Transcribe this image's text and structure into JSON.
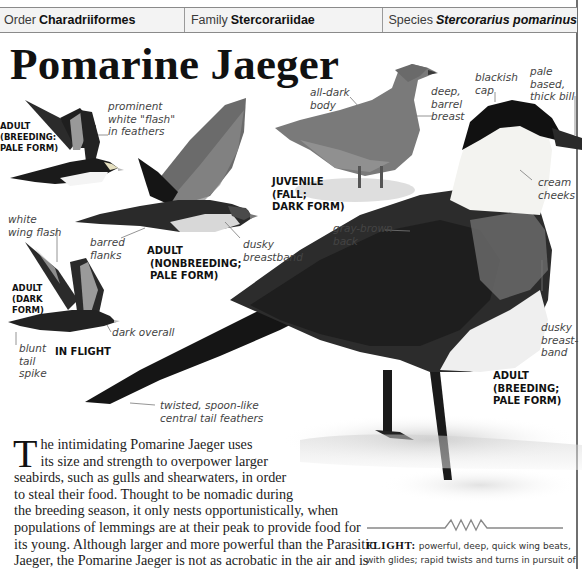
{
  "taxonomy": {
    "order_label": "Order",
    "order_value": "Charadriiformes",
    "family_label": "Family",
    "family_value": "Stercorariidae",
    "species_label": "Species",
    "species_value": "Stercorarius pomarinus"
  },
  "title": "Pomarine Jaeger",
  "illustrations": {
    "captions": {
      "adult_breeding_pale_flight": [
        "ADULT",
        "(BREEDING:",
        "PALE FORM)"
      ],
      "adult_nonbreeding_pale": [
        "ADULT",
        "(NONBREEDING;",
        "PALE FORM)"
      ],
      "adult_dark_form": [
        "ADULT",
        "(DARK",
        "FORM)"
      ],
      "in_flight": "IN FLIGHT",
      "juvenile": [
        "JUVENILE",
        "(FALL;",
        "DARK FORM)"
      ],
      "adult_breeding_pale_photo": [
        "ADULT",
        "(BREEDING;",
        "PALE FORM)"
      ]
    },
    "labels": {
      "prominent_flash": [
        "prominent",
        "white \"flash\"",
        "in feathers"
      ],
      "white_wing_flash": [
        "white",
        "wing flash"
      ],
      "barred_flanks": [
        "barred",
        "flanks"
      ],
      "dusky_breastband_flight": [
        "dusky",
        "breastband"
      ],
      "dark_overall": "dark overall",
      "blunt_tail_spike": [
        "blunt",
        "tail",
        "spike"
      ],
      "all_dark_body": [
        "all-dark",
        "body"
      ],
      "deep_barrel_breast": [
        "deep,",
        "barrel",
        "breast"
      ],
      "blackish_cap": [
        "blackish",
        "cap"
      ],
      "pale_based_bill": [
        "pale",
        "based,",
        "thick bill"
      ],
      "cream_cheeks": [
        "cream",
        "cheeks"
      ],
      "gray_brown_back": [
        "gray-brown",
        "back"
      ],
      "dusky_breastband_photo": [
        "dusky",
        "breast-",
        "band"
      ],
      "tail_feathers": [
        "twisted, spoon-like",
        "central tail feathers"
      ]
    }
  },
  "body": {
    "dropcap": "T",
    "lines": [
      "he intimidating Pomarine Jaeger uses",
      "its size and strength to overpower larger",
      "seabirds, such as gulls and shearwaters, in order",
      "to steal their food. Thought to be nomadic during",
      "the breeding season, it only nests opportunistically, when",
      "populations of lemmings are at their peak to provide food for",
      "its young. Although larger and more powerful than the Parasitic",
      "Jaeger, the Pomarine Jaeger is not as acrobatic in the air and is"
    ]
  },
  "flight": {
    "label": "FLIGHT:",
    "text": " powerful, deep, quick wing beats, with glides; rapid twists and turns in pursuit of prey."
  }
}
